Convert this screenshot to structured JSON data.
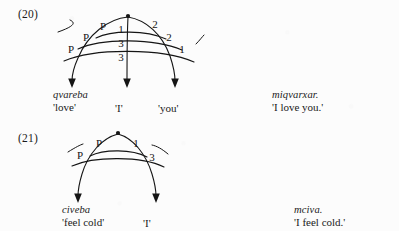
{
  "page": {
    "background_color": "#fcfcfc",
    "ink_color": "#1a1a1a",
    "content_type": "relational-grammar-stratal-diagrams",
    "language_described": "Georgian"
  },
  "examples": [
    {
      "number": "(20)",
      "diagram": {
        "apex_node": {
          "x": 128,
          "y": 16
        },
        "left_labels": [
          "P",
          "P",
          "P"
        ],
        "center_labels": [
          "1",
          "3",
          "3"
        ],
        "right_labels": [
          "2",
          "2",
          "1"
        ],
        "strata_count": 3,
        "arrow_count": 3
      },
      "glosses": [
        {
          "word": "qvareba",
          "meaning": "'love'"
        },
        {
          "word": "",
          "meaning": "'I'"
        },
        {
          "word": "",
          "meaning": "'you'"
        }
      ],
      "translation": {
        "surface_form": "miqvarxar.",
        "meaning": "'I love you.'"
      }
    },
    {
      "number": "(21)",
      "diagram": {
        "apex_node": {
          "x": 118,
          "y": 133
        },
        "left_labels": [
          "P",
          "P"
        ],
        "center_labels": [],
        "right_labels": [
          "1",
          "3"
        ],
        "strata_count": 2,
        "arrow_count": 2
      },
      "glosses": [
        {
          "word": "civeba",
          "meaning": "'feel cold'"
        },
        {
          "word": "",
          "meaning": "'I'"
        }
      ],
      "translation": {
        "surface_form": "mciva.",
        "meaning": "'I feel cold.'"
      }
    }
  ]
}
